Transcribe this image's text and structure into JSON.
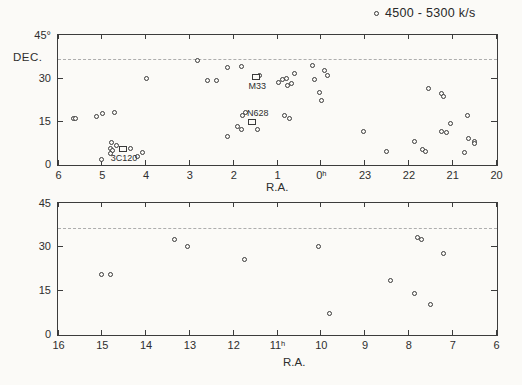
{
  "legend": {
    "marker": "open-circle",
    "label": "4500 - 5300 k/s"
  },
  "chart_data": {
    "type": "scatter",
    "panels": [
      {
        "name": "north-galactic-strip",
        "x_axis": {
          "title": "R.A.",
          "ticks": [
            "6",
            "5",
            "4",
            "3",
            "2",
            "1",
            "0ʰ",
            "23",
            "22",
            "21",
            "20"
          ],
          "start_hour": 6,
          "span_hours": 10
        },
        "y_axis": {
          "title": "DEC.",
          "ticks": [
            "45°",
            "30",
            "15",
            "0"
          ],
          "tick_values": [
            45,
            30,
            15,
            0
          ],
          "range": [
            0,
            45
          ],
          "right_tick_values": [
            30,
            15
          ]
        },
        "dashed_line_dec": 36.5,
        "points": [
          [
            5.65,
            16
          ],
          [
            5.59,
            16
          ],
          [
            5.12,
            16.5
          ],
          [
            4.99,
            17.5
          ],
          [
            4.71,
            18
          ],
          [
            3.97,
            30
          ],
          [
            2.82,
            36
          ],
          [
            2.59,
            29
          ],
          [
            2.38,
            29
          ],
          [
            2.13,
            33.5
          ],
          [
            1.81,
            34
          ],
          [
            1.72,
            18
          ],
          [
            1.78,
            17
          ],
          [
            1.9,
            13
          ],
          [
            1.81,
            12
          ],
          [
            1.44,
            12
          ],
          [
            2.12,
            9.5
          ],
          [
            0.84,
            17
          ],
          [
            0.72,
            16
          ],
          [
            1.39,
            31
          ],
          [
            0.97,
            28.5
          ],
          [
            0.88,
            29.5
          ],
          [
            0.79,
            30
          ],
          [
            0.75,
            27.5
          ],
          [
            0.66,
            28
          ],
          [
            0.6,
            31.5
          ],
          [
            0.19,
            34.5
          ],
          [
            23.92,
            32.5
          ],
          [
            23.84,
            31
          ],
          [
            0.15,
            29.5
          ],
          [
            0.04,
            25
          ],
          [
            23.98,
            22
          ],
          [
            23.02,
            11.5
          ],
          [
            22.49,
            4.5
          ],
          [
            21.85,
            8
          ],
          [
            21.68,
            5
          ],
          [
            21.6,
            4.5
          ],
          [
            21.53,
            26.5
          ],
          [
            21.25,
            24.5
          ],
          [
            21.19,
            23.5
          ],
          [
            21.25,
            11.5
          ],
          [
            21.13,
            11
          ],
          [
            21.04,
            14
          ],
          [
            20.64,
            17
          ],
          [
            20.62,
            9
          ],
          [
            20.5,
            8
          ],
          [
            20.49,
            7
          ],
          [
            20.72,
            4
          ],
          [
            4.77,
            7.5
          ],
          [
            4.67,
            6.5
          ],
          [
            4.8,
            5.5
          ],
          [
            4.75,
            4.6
          ],
          [
            4.8,
            3.8
          ],
          [
            4.34,
            5.5
          ],
          [
            4.18,
            2.5
          ],
          [
            4.07,
            4
          ],
          [
            5.01,
            1.5
          ]
        ],
        "squares": [
          {
            "ra": 1.47,
            "dec": 30.4,
            "label": "M33",
            "label_pos": "below",
            "dx": 1
          },
          {
            "ra": 1.57,
            "dec": 14.6,
            "label": "N628",
            "label_pos": "above",
            "dx": 7
          },
          {
            "ra": 4.52,
            "dec": 5.2,
            "label": "3C120",
            "label_pos": "below",
            "dx": 3
          }
        ]
      },
      {
        "name": "south-galactic-strip",
        "x_axis": {
          "title": "R.A.",
          "ticks": [
            "16",
            "15",
            "14",
            "13",
            "12",
            "11ʰ",
            "10",
            "9",
            "8",
            "7",
            "6"
          ],
          "start_hour": 16,
          "span_hours": 10
        },
        "y_axis": {
          "title": "",
          "ticks": [
            "45",
            "30",
            "15",
            "0"
          ],
          "tick_values": [
            45,
            30,
            15,
            0
          ],
          "range": [
            0,
            45
          ],
          "right_tick_values": [
            30,
            15
          ]
        },
        "dashed_line_dec": 36.5,
        "points": [
          [
            15.0,
            20.5
          ],
          [
            14.8,
            20.5
          ],
          [
            13.35,
            32.5
          ],
          [
            13.05,
            30
          ],
          [
            11.75,
            25.5
          ],
          [
            10.05,
            30
          ],
          [
            9.8,
            7
          ],
          [
            8.4,
            18.5
          ],
          [
            7.8,
            33
          ],
          [
            7.7,
            32.5
          ],
          [
            7.2,
            27.5
          ],
          [
            7.85,
            14
          ],
          [
            7.5,
            10
          ]
        ],
        "squares": []
      }
    ]
  }
}
